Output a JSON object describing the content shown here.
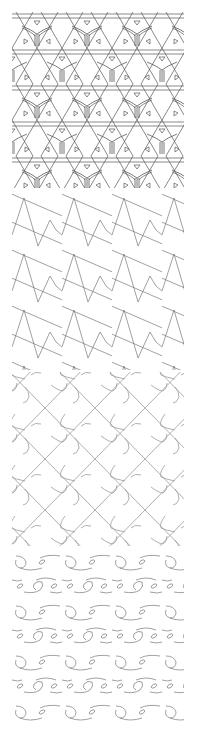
{
  "figure": {
    "background": "#ffffff",
    "panels": [
      {
        "id": "p1",
        "name": "triangular-grid-with-trefoil-motifs",
        "stroke": "#555555",
        "description": "Horizontal double lines and ±60° diagonals forming a triangular lattice; Y-shaped three-armed motifs with small triangle tabs inside triangles"
      },
      {
        "id": "p2",
        "name": "zigzag-with-slanted-lines",
        "stroke": "#777777",
        "description": "Large zigzag waves with small inner zigzags crossed by parallel lines sloping down to the right"
      },
      {
        "id": "p3",
        "name": "diagonal-lattice-with-s-hooks",
        "stroke": "#9a9a9a",
        "description": "Diagonal X lattice with curved S/Z shaped hooks between crossings"
      },
      {
        "id": "p4",
        "name": "wave-scroll-rows",
        "stroke": "#888888",
        "description": "Alternating rows of wave scrolls with circular loops and small ovals"
      }
    ]
  }
}
